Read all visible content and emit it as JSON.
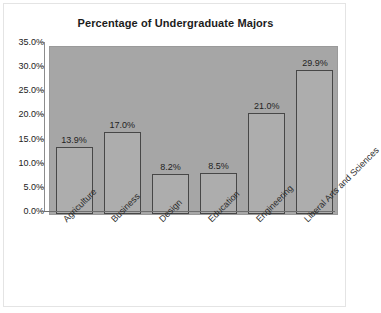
{
  "chart_data": {
    "type": "bar",
    "title": "Percentage of Undergraduate Majors",
    "xlabel": "",
    "ylabel": "",
    "categories": [
      "Agriculture",
      "Business",
      "Design",
      "Education",
      "Engineering",
      "Liberal Arts and Sciences"
    ],
    "values": [
      13.9,
      17.0,
      8.2,
      8.5,
      21.0,
      29.9
    ],
    "value_labels": [
      "13.9%",
      "17.0%",
      "8.2%",
      "8.5%",
      "21.0%",
      "29.9%"
    ],
    "ylim": [
      0,
      35
    ],
    "ytick_values": [
      0,
      5,
      10,
      15,
      20,
      25,
      30,
      35
    ],
    "ytick_labels": [
      "0.0%",
      "5.0%",
      "10.0%",
      "15.0%",
      "20.0%",
      "25.0%",
      "30.0%",
      "35.0%"
    ],
    "grid": false,
    "legend": false,
    "colors": {
      "bar_fill": "#adadad",
      "bar_border": "#474747",
      "plot_background": "#a6a6a6",
      "chart_background": "#ffffff",
      "text": "#1c1c1c"
    }
  }
}
